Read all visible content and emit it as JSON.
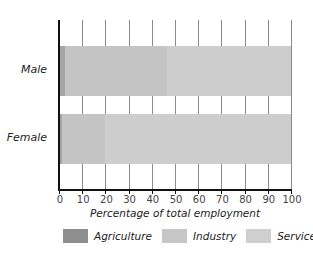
{
  "chart_data": {
    "type": "bar",
    "orientation": "horizontal",
    "stacked": true,
    "categories": [
      "Male",
      "Female"
    ],
    "series": [
      {
        "name": "Agriculture",
        "color": "#a6a6a6",
        "values": [
          2.5,
          1.5
        ]
      },
      {
        "name": "Industry",
        "color": "#c4c4c4",
        "values": [
          44,
          18.5
        ]
      },
      {
        "name": "Services",
        "color": "#cdcdcd",
        "values": [
          53.5,
          80
        ]
      }
    ],
    "title": "",
    "xlabel": "Percentage of total employment",
    "ylabel": "",
    "xlim": [
      0,
      100
    ],
    "xticks": [
      "0",
      "10",
      "20",
      "30",
      "40",
      "50",
      "60",
      "70",
      "80",
      "90",
      "100"
    ],
    "grid": true,
    "legend_position": "bottom"
  }
}
